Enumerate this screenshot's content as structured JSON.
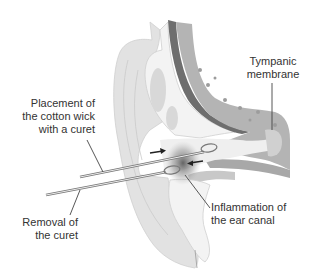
{
  "figure": {
    "colors": {
      "skin_light": "#e4e4e4",
      "skin_mid": "#d2d2d2",
      "cartilage": "#f4f4f4",
      "bone": "#b4b4b4",
      "dark_band": "#6e6e6e",
      "inflammation": "#555555",
      "text": "#333333"
    },
    "labels": {
      "tympanic": [
        "Tympanic",
        "membrane"
      ],
      "placement": [
        "Placement of",
        "the cotton wick",
        "with a curet"
      ],
      "removal": [
        "Removal of",
        "the curet"
      ],
      "inflammation": [
        "Inflammation of",
        "the ear canal"
      ]
    }
  }
}
